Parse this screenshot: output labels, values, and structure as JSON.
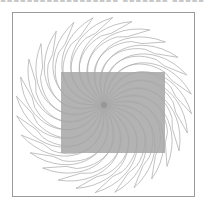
{
  "header": {
    "clipped_text": "▪▪▪▪▪▪▪▪▪▪▪▪▪▪▪▪▪▪  ▪▪▪▪▪▪▪  ▪▪▪▪▪  ▪▪"
  },
  "figure": {
    "center": [
      104,
      105
    ],
    "arm_count": 28,
    "arm_radius": 88,
    "twist_degrees": 70,
    "frame": {
      "x": 12,
      "y": 12,
      "width": 183,
      "height": 185,
      "border_color": "#9a9a9a"
    },
    "rect": {
      "x": 61,
      "y": 72,
      "width": 104,
      "height": 81,
      "fill": "#b3b3b3"
    },
    "colors": {
      "arm_stroke": "#a8a8a8",
      "arm_stroke_inner": "#8c8c8c",
      "background": "#ffffff"
    }
  }
}
